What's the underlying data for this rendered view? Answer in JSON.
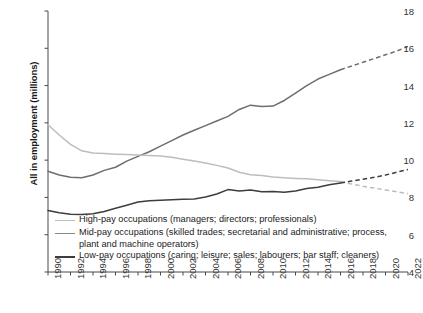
{
  "chart_data": {
    "type": "line",
    "title": "",
    "xlabel": "",
    "ylabel": "All in employment (millions)",
    "xlim": [
      1990,
      2022
    ],
    "ylim": [
      4,
      18
    ],
    "ytick_labels": [
      "4",
      "6",
      "8",
      "10",
      "12",
      "14",
      "16",
      "18"
    ],
    "yticks": [
      4,
      6,
      8,
      10,
      12,
      14,
      16,
      18
    ],
    "xtick_labels": [
      "1990",
      "1992",
      "1994",
      "1996",
      "1998",
      "2000",
      "2002",
      "2004",
      "2006",
      "2008",
      "2010",
      "2012",
      "2014",
      "2016",
      "2018",
      "2020",
      "2022"
    ],
    "xticks": [
      1990,
      1992,
      1994,
      1996,
      1998,
      2000,
      2002,
      2004,
      2006,
      2008,
      2010,
      2012,
      2014,
      2016,
      2018,
      2020,
      2022
    ],
    "grid": false,
    "legend_position": "lower-left-inside",
    "forecast_start_year": 2016,
    "forecast_style": "dashed",
    "x": [
      1990,
      1991,
      1992,
      1993,
      1994,
      1995,
      1996,
      1997,
      1998,
      1999,
      2000,
      2001,
      2002,
      2003,
      2004,
      2005,
      2006,
      2007,
      2008,
      2009,
      2010,
      2011,
      2012,
      2013,
      2014,
      2015,
      2016,
      2017,
      2018,
      2019,
      2020,
      2021,
      2022
    ],
    "series": [
      {
        "name": "High-pay occupations (managers; directors; professionals)",
        "color": "#6e6e6e",
        "values": [
          9.4,
          9.2,
          9.08,
          9.06,
          9.2,
          9.45,
          9.62,
          9.95,
          10.2,
          10.45,
          10.75,
          11.05,
          11.35,
          11.6,
          11.85,
          12.1,
          12.35,
          12.72,
          12.95,
          12.88,
          12.9,
          13.2,
          13.6,
          14.0,
          14.35,
          14.6,
          14.85,
          15.05,
          15.25,
          15.45,
          15.65,
          15.85,
          16.1
        ],
        "last_solid_index": 26
      },
      {
        "name": "Mid-pay occupations (skilled trades; secretarial and administrative; process, plant and machine operators)",
        "color": "#bdbdbd",
        "values": [
          11.9,
          11.35,
          10.85,
          10.5,
          10.38,
          10.35,
          10.32,
          10.3,
          10.28,
          10.25,
          10.22,
          10.15,
          10.05,
          9.95,
          9.85,
          9.72,
          9.58,
          9.35,
          9.22,
          9.18,
          9.1,
          9.05,
          9.02,
          9.0,
          8.95,
          8.9,
          8.85,
          8.72,
          8.6,
          8.5,
          8.4,
          8.3,
          8.2
        ],
        "last_solid_index": 26
      },
      {
        "name": "Low-pay occupations (caring; leisure; sales; labourers; bar staff; cleaners)",
        "color": "#3d3d3d",
        "values": [
          7.3,
          7.18,
          7.1,
          7.08,
          7.12,
          7.25,
          7.42,
          7.58,
          7.75,
          7.82,
          7.85,
          7.88,
          7.9,
          7.92,
          8.02,
          8.18,
          8.42,
          8.35,
          8.4,
          8.3,
          8.32,
          8.28,
          8.35,
          8.48,
          8.55,
          8.68,
          8.78,
          8.88,
          8.98,
          9.08,
          9.2,
          9.35,
          9.5
        ],
        "last_solid_index": 26
      }
    ]
  },
  "legend": {
    "items": [
      {
        "label": "High-pay occupations (managers; directors; professionals)",
        "color": "#bdbdbd"
      },
      {
        "label": "Mid-pay occupations (skilled trades; secretarial and administrative; process,",
        "label2": "plant and machine operators)",
        "color": "#8a8a8a"
      },
      {
        "label": "Low-pay occupations (caring; leisure; sales; labourers; bar staff; cleaners)",
        "color": "#3d3d3d"
      }
    ]
  },
  "axis": {
    "ylabel": "All in employment (millions)"
  }
}
